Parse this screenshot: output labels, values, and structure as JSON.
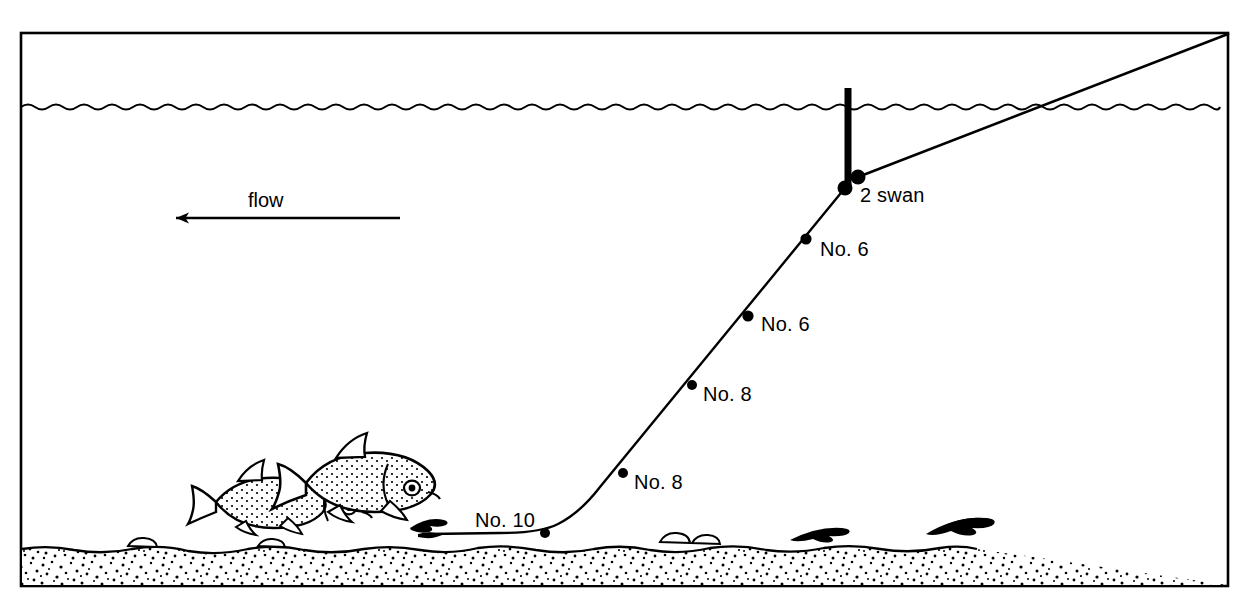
{
  "diagram": {
    "frame": {
      "x": 21,
      "y": 33,
      "width": 1207,
      "height": 553,
      "stroke_color": "#000000"
    },
    "water_surface": {
      "label": "water surface",
      "y": 107
    },
    "riverbed": {
      "label": "gravel riverbed",
      "top_y": 547,
      "bottom_y": 586,
      "fill_color": "#ffffff",
      "speckle_color": "#000000"
    },
    "flow_arrow": {
      "label": "flow",
      "direction": "left",
      "x_start": 400,
      "x_end": 172,
      "y": 218,
      "label_x": 248,
      "label_y": 207
    },
    "float": {
      "name": "float",
      "top_y": 88,
      "bottom_y": 188,
      "x": 848,
      "color": "#000000"
    },
    "rod_line": {
      "name": "line-to-rod",
      "from_x": 858,
      "from_y": 177,
      "to_x": 1228,
      "to_y": 33
    },
    "shots": [
      {
        "label": "2 swan",
        "x": 845,
        "y": 188,
        "label_x": 860,
        "label_y": 202,
        "size": 7
      },
      {
        "label": "No. 6",
        "x": 806,
        "y": 239,
        "label_x": 820,
        "label_y": 256,
        "size": 5
      },
      {
        "label": "No. 6",
        "x": 748,
        "y": 316,
        "label_x": 761,
        "label_y": 331,
        "size": 5
      },
      {
        "label": "No. 8",
        "x": 692,
        "y": 385,
        "label_x": 703,
        "label_y": 401,
        "size": 4
      },
      {
        "label": "No. 8",
        "x": 623,
        "y": 473,
        "label_x": 634,
        "label_y": 489,
        "size": 4
      },
      {
        "label": "No. 10",
        "x": 545,
        "y": 533,
        "label_x": 475,
        "label_y": 527,
        "size": 4
      }
    ],
    "anchor_dot": {
      "x": 858,
      "y": 177,
      "size": 7
    },
    "terminal_line": {
      "name": "terminal-tackle-line",
      "path_description": "from hook at riverbed left, along bed, rising steeply to float"
    },
    "fish": [
      {
        "name": "fish-small",
        "cx": 265,
        "cy": 500,
        "length": 108,
        "facing": "right"
      },
      {
        "name": "fish-large",
        "cx": 362,
        "cy": 482,
        "length": 128,
        "facing": "right"
      }
    ],
    "hook_bait": {
      "x": 432,
      "y": 531,
      "label": "hook and bait"
    },
    "weeds": [
      {
        "x": 820,
        "y": 536
      },
      {
        "x": 955,
        "y": 530
      }
    ],
    "pebbles": [
      {
        "x": 140,
        "y": 545
      },
      {
        "x": 268,
        "y": 545
      },
      {
        "x": 672,
        "y": 541
      },
      {
        "x": 700,
        "y": 541
      }
    ]
  }
}
